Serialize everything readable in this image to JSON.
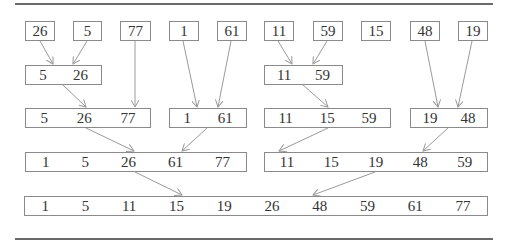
{
  "rows": [
    {
      "name": "level-1",
      "boxes": [
        {
          "values": [
            "26"
          ]
        },
        {
          "values": [
            "5"
          ]
        },
        {
          "values": [
            "77"
          ]
        },
        {
          "values": [
            "1"
          ]
        },
        {
          "values": [
            "61"
          ]
        },
        {
          "values": [
            "11"
          ]
        },
        {
          "values": [
            "59"
          ]
        },
        {
          "values": [
            "15"
          ]
        },
        {
          "values": [
            "48"
          ]
        },
        {
          "values": [
            "19"
          ]
        }
      ]
    },
    {
      "name": "level-2",
      "boxes": [
        {
          "values": [
            "5",
            "26"
          ]
        },
        {
          "values": [
            "11",
            "59"
          ]
        }
      ]
    },
    {
      "name": "level-3",
      "boxes": [
        {
          "values": [
            "5",
            "26",
            "77"
          ]
        },
        {
          "values": [
            "1",
            "61"
          ]
        },
        {
          "values": [
            "11",
            "15",
            "59"
          ]
        },
        {
          "values": [
            "19",
            "48"
          ]
        }
      ]
    },
    {
      "name": "level-4",
      "boxes": [
        {
          "values": [
            "1",
            "5",
            "26",
            "61",
            "77"
          ]
        },
        {
          "values": [
            "11",
            "15",
            "19",
            "48",
            "59"
          ]
        }
      ]
    },
    {
      "name": "level-5",
      "boxes": [
        {
          "values": [
            "1",
            "5",
            "11",
            "15",
            "19",
            "26",
            "48",
            "59",
            "61",
            "77"
          ]
        }
      ]
    }
  ],
  "colors": {
    "box_border": "#8a8a8a",
    "arrow": "#9a9a9a",
    "rule": "#6a6a6a",
    "text": "#333333"
  }
}
